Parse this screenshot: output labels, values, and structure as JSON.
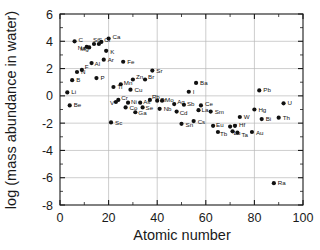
{
  "chart_data": {
    "type": "scatter",
    "title": "",
    "xlabel": "Atomic number",
    "ylabel": "log (mass abundance in water)",
    "xlim": [
      0,
      100
    ],
    "ylim": [
      -8,
      6
    ],
    "xticks": [
      "0",
      "20",
      "40",
      "60",
      "80",
      "100"
    ],
    "yticks": [
      "6",
      "4",
      "2",
      "0",
      "-2",
      "-4",
      "-6",
      "-8"
    ],
    "xtick_values": [
      0,
      20,
      40,
      60,
      80,
      100
    ],
    "ytick_values": [
      6,
      4,
      2,
      0,
      -2,
      -4,
      -6,
      -8
    ],
    "grid": true,
    "grid_note": "light vertical gridlines at x=20,40,60,80 and light horizontal gridlines at y=4,2,0,-2,-4,-6",
    "legend": "none",
    "marker": "filled-circle",
    "marker_color": "#111111",
    "series": [
      {
        "name": "elements",
        "points": [
          {
            "label": "Li",
            "x": 3,
            "y": 0.25
          },
          {
            "label": "Be",
            "x": 4,
            "y": -0.7
          },
          {
            "label": "B",
            "x": 5,
            "y": 1.15
          },
          {
            "label": "C",
            "x": 6,
            "y": 4.0
          },
          {
            "label": "N",
            "x": 7,
            "y": 1.75
          },
          {
            "label": "F",
            "x": 9,
            "y": 1.9
          },
          {
            "label": "Na",
            "x": 11,
            "y": 3.6
          },
          {
            "label": "Mg",
            "x": 12,
            "y": 3.55
          },
          {
            "label": "Al",
            "x": 13,
            "y": 2.4
          },
          {
            "label": "Si",
            "x": 14,
            "y": 3.8
          },
          {
            "label": "P",
            "x": 15,
            "y": 1.3
          },
          {
            "label": "S",
            "x": 16,
            "y": 3.8
          },
          {
            "label": "Cl",
            "x": 17,
            "y": 3.95
          },
          {
            "label": "Ar",
            "x": 18,
            "y": 2.65
          },
          {
            "label": "K",
            "x": 19,
            "y": 3.3
          },
          {
            "label": "Ca",
            "x": 20,
            "y": 4.2
          },
          {
            "label": "Sc",
            "x": 21,
            "y": -1.95
          },
          {
            "label": "Ti",
            "x": 22,
            "y": 0.65
          },
          {
            "label": "V",
            "x": 23,
            "y": -0.45
          },
          {
            "label": "Cr",
            "x": 24,
            "y": -0.3
          },
          {
            "label": "Mn",
            "x": 25,
            "y": 0.85
          },
          {
            "label": "Fe",
            "x": 26,
            "y": 2.5
          },
          {
            "label": "Co",
            "x": 27,
            "y": -0.85
          },
          {
            "label": "Ni",
            "x": 28,
            "y": -0.5
          },
          {
            "label": "Cu",
            "x": 29,
            "y": 0.45
          },
          {
            "label": "Zn",
            "x": 30,
            "y": 1.2
          },
          {
            "label": "Ga",
            "x": 31,
            "y": -1.2
          },
          {
            "label": "Se",
            "x": 34,
            "y": -0.85
          },
          {
            "label": "As",
            "x": 33,
            "y": -0.5
          },
          {
            "label": "Br",
            "x": 35,
            "y": 1.2
          },
          {
            "label": "Sr",
            "x": 38,
            "y": 1.85
          },
          {
            "label": "Rb",
            "x": 37,
            "y": -0.3
          },
          {
            "label": "Zr",
            "x": 40,
            "y": -0.35
          },
          {
            "label": "Mo",
            "x": 42,
            "y": -0.35
          },
          {
            "label": "Nb",
            "x": 41,
            "y": -0.95
          },
          {
            "label": "Ag",
            "x": 47,
            "y": -0.6
          },
          {
            "label": "Cd",
            "x": 48,
            "y": -1.15
          },
          {
            "label": "Sn",
            "x": 50,
            "y": -2.05
          },
          {
            "label": "Sb",
            "x": 51,
            "y": -0.65
          },
          {
            "label": "I",
            "x": 53,
            "y": 0.3
          },
          {
            "label": "Cs",
            "x": 55,
            "y": -1.85
          },
          {
            "label": "Ba",
            "x": 56,
            "y": 0.95
          },
          {
            "label": "La",
            "x": 57,
            "y": -1.05
          },
          {
            "label": "Ce",
            "x": 58,
            "y": -0.7
          },
          {
            "label": "Sm",
            "x": 62,
            "y": -1.15
          },
          {
            "label": "Eu",
            "x": 63,
            "y": -2.2
          },
          {
            "label": "Tb",
            "x": 65,
            "y": -2.65
          },
          {
            "label": "Y",
            "x": 70,
            "y": -2.25
          },
          {
            "label": "Hf",
            "x": 72,
            "y": -2.2
          },
          {
            "label": "Lu",
            "x": 71,
            "y": -2.6
          },
          {
            "label": "Ta",
            "x": 73,
            "y": -2.7
          },
          {
            "label": "W",
            "x": 74,
            "y": -1.55
          },
          {
            "label": "Au",
            "x": 79,
            "y": -2.65
          },
          {
            "label": "Hg",
            "x": 80,
            "y": -1.0
          },
          {
            "label": "Pb",
            "x": 82,
            "y": 0.4
          },
          {
            "label": "Bi",
            "x": 83,
            "y": -1.7
          },
          {
            "label": "Ra",
            "x": 88,
            "y": -6.4
          },
          {
            "label": "Th",
            "x": 90,
            "y": -1.6
          },
          {
            "label": "U",
            "x": 92,
            "y": -0.55
          }
        ]
      }
    ],
    "label_offsets": {
      "Li": [
        4,
        2
      ],
      "Be": [
        4,
        2
      ],
      "B": [
        4,
        2
      ],
      "C": [
        4,
        1
      ],
      "N": [
        4,
        2
      ],
      "F": [
        3,
        -1
      ],
      "Na": [
        -9,
        3
      ],
      "Mg": [
        -9,
        4
      ],
      "Al": [
        3,
        3
      ],
      "Si": [
        -1,
        -2
      ],
      "P": [
        4,
        2
      ],
      "S": [
        -1,
        -2
      ],
      "Cl": [
        3,
        0
      ],
      "Ar": [
        4,
        2
      ],
      "K": [
        4,
        3
      ],
      "Ca": [
        4,
        0
      ],
      "Sc": [
        4,
        3
      ],
      "Ti": [
        4,
        2
      ],
      "V": [
        -6,
        3
      ],
      "Cr": [
        3,
        0
      ],
      "Mn": [
        3,
        1
      ],
      "Fe": [
        4,
        2
      ],
      "Co": [
        4,
        3
      ],
      "Ni": [
        3,
        1
      ],
      "Cu": [
        4,
        2
      ],
      "Zn": [
        3,
        0
      ],
      "Ga": [
        3,
        3
      ],
      "Se": [
        3,
        3
      ],
      "As": [
        3,
        1
      ],
      "Br": [
        3,
        0
      ],
      "Sr": [
        4,
        2
      ],
      "Rb": [
        2,
        -1
      ],
      "Zr": [
        3,
        1
      ],
      "Mo": [
        3,
        1
      ],
      "Nb": [
        4,
        2
      ],
      "Ag": [
        3,
        0
      ],
      "Cd": [
        3,
        3
      ],
      "Sn": [
        4,
        3
      ],
      "Sb": [
        3,
        1
      ],
      "I": [
        4,
        2
      ],
      "Cs": [
        4,
        3
      ],
      "Ba": [
        4,
        2
      ],
      "La": [
        3,
        2
      ],
      "Ce": [
        4,
        1
      ],
      "Sm": [
        4,
        2
      ],
      "Eu": [
        3,
        1
      ],
      "Tb": [
        2,
        4
      ],
      "Y": [
        3,
        1
      ],
      "Hf": [
        4,
        1
      ],
      "Lu": [
        1,
        4
      ],
      "Ta": [
        4,
        4
      ],
      "W": [
        4,
        2
      ],
      "Au": [
        4,
        3
      ],
      "Hg": [
        4,
        2
      ],
      "Pb": [
        4,
        2
      ],
      "Bi": [
        4,
        2
      ],
      "Ra": [
        4,
        2
      ],
      "Th": [
        4,
        2
      ],
      "U": [
        4,
        2
      ]
    }
  }
}
